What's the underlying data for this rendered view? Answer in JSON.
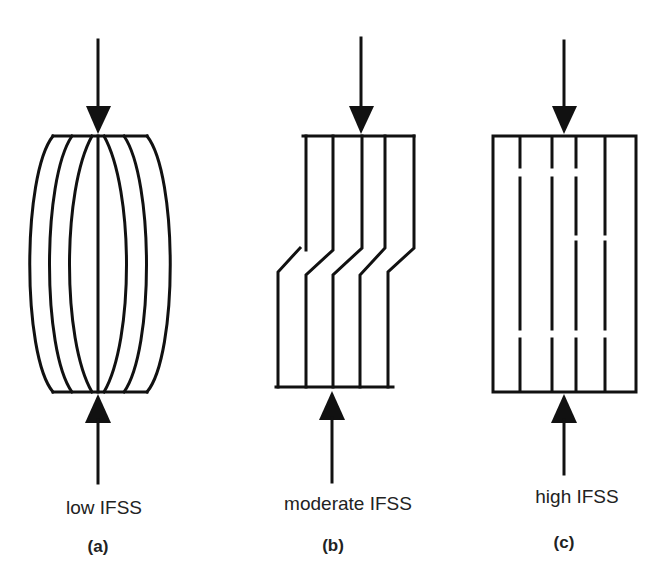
{
  "figure": {
    "panels": [
      {
        "id": "a",
        "label": "low IFSS",
        "tag": "(a)",
        "mode": "fiber buckling / bulging outward"
      },
      {
        "id": "b",
        "label": "moderate IFSS",
        "tag": "(b)",
        "mode": "shear kinking of fibers"
      },
      {
        "id": "c",
        "label": "high IFSS",
        "tag": "(c)",
        "mode": "fiber fragmentation / breaks"
      }
    ],
    "colors": {
      "line": "#111111",
      "background": "#ffffff",
      "text": "#222222"
    }
  }
}
